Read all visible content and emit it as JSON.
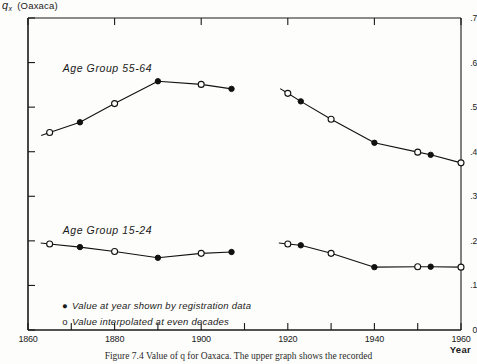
{
  "figure": {
    "y_axis_symbol": "q",
    "y_axis_subscript": "x",
    "y_axis_region": "(Oaxaca)",
    "x_axis_label": "Year",
    "caption": "Figure 7.4    Value of q  for Oaxaca. The upper graph shows the recorded"
  },
  "legend": {
    "filled_marker": "●",
    "filled_text": "Value at year shown by registration data",
    "open_marker": "o",
    "open_text": "Value interpolated at even decades"
  },
  "labels": {
    "upper_series": "Age Group 55-64",
    "lower_series": "Age Group 15-24"
  },
  "ticks": {
    "y": [
      ".7",
      ".6",
      ".5",
      ".4",
      ".3",
      ".2",
      ".1",
      "0"
    ],
    "x": [
      "1860",
      "1880",
      "1900",
      "1920",
      "1940",
      "1960"
    ]
  },
  "colors": {
    "line": "#111111",
    "axis": "#1a1a1a",
    "background": "#fdfdfb"
  },
  "chart_data": {
    "type": "line",
    "title": "Value of q for Oaxaca",
    "xlabel": "Year",
    "ylabel": "q_x",
    "xlim": [
      1860,
      1960
    ],
    "ylim": [
      0.0,
      0.7
    ],
    "grid": false,
    "legend_position": "bottom-left-inside",
    "series": [
      {
        "name": "Age Group 55-64",
        "segment": "left",
        "points": [
          {
            "year": 1865,
            "value": 0.443,
            "marker": "open"
          },
          {
            "year": 1872,
            "value": 0.466,
            "marker": "filled"
          },
          {
            "year": 1880,
            "value": 0.508,
            "marker": "open"
          },
          {
            "year": 1890,
            "value": 0.558,
            "marker": "filled"
          },
          {
            "year": 1900,
            "value": 0.551,
            "marker": "open"
          },
          {
            "year": 1907,
            "value": 0.541,
            "marker": "filled"
          }
        ]
      },
      {
        "name": "Age Group 55-64",
        "segment": "right",
        "points": [
          {
            "year": 1920,
            "value": 0.531,
            "marker": "open"
          },
          {
            "year": 1923,
            "value": 0.513,
            "marker": "filled"
          },
          {
            "year": 1930,
            "value": 0.473,
            "marker": "open"
          },
          {
            "year": 1940,
            "value": 0.42,
            "marker": "filled"
          },
          {
            "year": 1950,
            "value": 0.399,
            "marker": "open"
          },
          {
            "year": 1953,
            "value": 0.393,
            "marker": "filled"
          },
          {
            "year": 1960,
            "value": 0.375,
            "marker": "open"
          }
        ]
      },
      {
        "name": "Age Group 15-24",
        "segment": "left",
        "points": [
          {
            "year": 1865,
            "value": 0.193,
            "marker": "open"
          },
          {
            "year": 1872,
            "value": 0.186,
            "marker": "filled"
          },
          {
            "year": 1880,
            "value": 0.176,
            "marker": "open"
          },
          {
            "year": 1890,
            "value": 0.162,
            "marker": "filled"
          },
          {
            "year": 1900,
            "value": 0.172,
            "marker": "open"
          },
          {
            "year": 1907,
            "value": 0.175,
            "marker": "filled"
          }
        ]
      },
      {
        "name": "Age Group 15-24",
        "segment": "right",
        "points": [
          {
            "year": 1920,
            "value": 0.193,
            "marker": "open"
          },
          {
            "year": 1923,
            "value": 0.19,
            "marker": "filled"
          },
          {
            "year": 1930,
            "value": 0.172,
            "marker": "open"
          },
          {
            "year": 1940,
            "value": 0.141,
            "marker": "filled"
          },
          {
            "year": 1950,
            "value": 0.142,
            "marker": "open"
          },
          {
            "year": 1953,
            "value": 0.142,
            "marker": "filled"
          },
          {
            "year": 1960,
            "value": 0.141,
            "marker": "open"
          }
        ]
      }
    ]
  }
}
